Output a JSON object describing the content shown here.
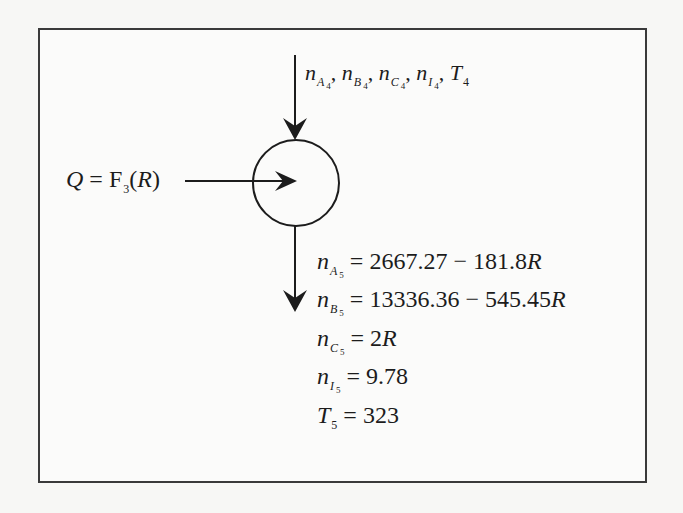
{
  "diagram": {
    "type": "process-flow-node",
    "node": {
      "shape": "circle",
      "label": ""
    },
    "input_stream": {
      "direction": "down-into-node",
      "variables": [
        {
          "symbol": "n",
          "sub": "A",
          "stream": "4"
        },
        {
          "symbol": "n",
          "sub": "B",
          "stream": "4"
        },
        {
          "symbol": "n",
          "sub": "C",
          "stream": "4"
        },
        {
          "symbol": "n",
          "sub": "I",
          "stream": "4"
        },
        {
          "symbol": "T",
          "sub": "",
          "stream": "4"
        }
      ],
      "separator": ","
    },
    "heat_input": {
      "direction": "right-into-node",
      "lhs": "Q",
      "equals": "=",
      "func": "F",
      "func_sub": "3",
      "open": "(",
      "arg": "R",
      "close": ")"
    },
    "output_stream": {
      "direction": "down-out-of-node",
      "equations": [
        {
          "symbol": "n",
          "sub": "A",
          "stream": "5",
          "equals": "=",
          "rhs": "2667.27 − 181.8",
          "rhs_var": "R"
        },
        {
          "symbol": "n",
          "sub": "B",
          "stream": "5",
          "equals": "=",
          "rhs": "13336.36 − 545.45",
          "rhs_var": "R"
        },
        {
          "symbol": "n",
          "sub": "C",
          "stream": "5",
          "equals": "=",
          "rhs": "2",
          "rhs_var": "R"
        },
        {
          "symbol": "n",
          "sub": "I",
          "stream": "5",
          "equals": "=",
          "rhs": "9.78",
          "rhs_var": ""
        },
        {
          "symbol": "T",
          "sub": "",
          "stream": "5",
          "equals": "=",
          "rhs": "323",
          "rhs_var": ""
        }
      ]
    }
  },
  "colors": {
    "ink": "#1c1c1c",
    "border": "#3a3a3a",
    "paper": "#fbfbfa"
  }
}
